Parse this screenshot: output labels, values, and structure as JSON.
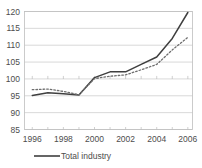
{
  "chart_data": {
    "type": "line",
    "title": "",
    "xlabel": "",
    "ylabel": "",
    "xlim": [
      1995.5,
      2006.3
    ],
    "ylim": [
      85,
      120
    ],
    "grid": true,
    "legend_position": "bottom",
    "y_ticks": [
      85,
      90,
      95,
      100,
      105,
      110,
      115,
      120
    ],
    "y_tick_labels": [
      "85",
      "90",
      "95",
      "100",
      "105",
      "110",
      "115",
      "120"
    ],
    "x_ticks": [
      1996,
      1998,
      2000,
      2002,
      2004,
      2006
    ],
    "x_tick_labels": [
      "1996",
      "1998",
      "2000",
      "2002",
      "2004",
      "2006"
    ],
    "x": [
      1996,
      1997,
      1998,
      1999,
      2000,
      2001,
      2002,
      2003,
      2004,
      2005,
      2006
    ],
    "series": [
      {
        "name": "Total industry",
        "style": "solid",
        "color": "#3f3f3f",
        "values": [
          95.1,
          95.9,
          95.6,
          95.2,
          100.4,
          102.1,
          102.1,
          104.3,
          106.5,
          112.0,
          119.7
        ]
      },
      {
        "name": "",
        "style": "dotted",
        "color": "#6e6e6e",
        "values": [
          96.8,
          97.0,
          96.3,
          95.3,
          100.1,
          100.8,
          101.2,
          102.7,
          104.3,
          108.6,
          112.3
        ]
      }
    ]
  },
  "legend": {
    "entries": [
      {
        "label": "Total industry",
        "style": "solid",
        "color": "#3f3f3f"
      }
    ]
  },
  "colors": {
    "grid": "#bfbfbf",
    "frame": "#bfbfbf",
    "text": "#4d4d4d",
    "series_primary": "#3f3f3f",
    "series_secondary": "#6e6e6e",
    "background": "#ffffff"
  }
}
